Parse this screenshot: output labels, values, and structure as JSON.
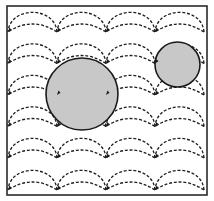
{
  "diagram": {
    "title": "",
    "colors": {
      "frame": "#2a2a2a",
      "arc": "#1e1e1e",
      "obstacle_fill": "#c8c8c8",
      "obstacle_stroke": "#1a1a1a",
      "background": "#ffffff"
    },
    "frame": {
      "x": 7,
      "y": 6,
      "width": 200,
      "height": 189
    },
    "grid": {
      "node_x": [
        8,
        57,
        106,
        155,
        204
      ],
      "row_y": [
        32,
        63.5,
        95,
        126.5,
        158,
        190
      ],
      "upper_arc_height": 21,
      "lower_arc_height": 8
    },
    "obstacles": [
      {
        "name": "large-obstacle",
        "cx": 82,
        "cy": 94,
        "r": 36
      },
      {
        "name": "small-obstacle",
        "cx": 177.5,
        "cy": 64.5,
        "r": 22.5
      }
    ],
    "arrow_direction": "right-to-left"
  }
}
